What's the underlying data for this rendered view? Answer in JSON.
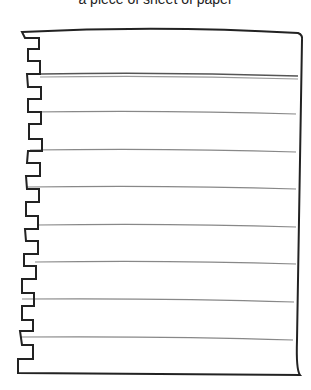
{
  "caption": "a piece of sheet of paper",
  "paper": {
    "stroke_color": "#222222",
    "line_color": "#777777",
    "ruled_lines_y": [
      112,
      150,
      187,
      225,
      262,
      300,
      338
    ],
    "header_double_line_y": 75
  }
}
